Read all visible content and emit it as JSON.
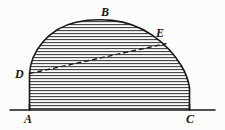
{
  "figure": {
    "kind": "geometry-diagram",
    "canvas": {
      "width": 225,
      "height": 130
    },
    "colors": {
      "paper": "#fbfbf9",
      "ink": "#1a1816",
      "hatch": "#3a3734",
      "dash": "#201e1b"
    }
  },
  "labels": [
    {
      "id": "A",
      "text": "A",
      "x": 24,
      "y": 113,
      "describes": "left foot of the arc on the base line"
    },
    {
      "id": "B",
      "text": "B",
      "x": 101,
      "y": 6,
      "describes": "apex of the arc"
    },
    {
      "id": "C",
      "text": "C",
      "x": 186,
      "y": 113,
      "describes": "right foot of the arc on the base line"
    },
    {
      "id": "D",
      "text": "D",
      "x": 15,
      "y": 68,
      "describes": "point on the left arc, left end of the dashed chord"
    },
    {
      "id": "E",
      "text": "E",
      "x": 156,
      "y": 27,
      "describes": "point on the right arc, right end of the dashed chord"
    }
  ],
  "geometry": {
    "baseline": {
      "name": "base-line",
      "x1": 10,
      "y1": 110,
      "x2": 215,
      "y2": 110
    },
    "arc": {
      "name": "dome-arc",
      "path": "M 29.5 110 L 29.5 74 C 30.5 52 48 28.5 76 22.2 C 88 19.6 100 19.2 112 20.4 C 142 23.4 167 42 181.5 66 C 186 73.6 188.6 81 189.5 88 L 189.5 110",
      "left_foot": {
        "x": 29.5,
        "y": 110
      },
      "apex": {
        "x": 104,
        "y": 20
      },
      "right_foot": {
        "x": 189.5,
        "y": 110
      }
    },
    "chord": {
      "name": "chord-DE",
      "style": "dashed",
      "from": {
        "label": "D",
        "x": 29.5,
        "y": 73.5
      },
      "to": {
        "label": "E",
        "x": 166.5,
        "y": 43.5
      },
      "dash_pattern": "5 3"
    },
    "hatching": {
      "name": "horizontal-hatch-fill",
      "orientation": "horizontal",
      "spacing_px": 3,
      "stroke_width_px": 1,
      "top_y": 23,
      "bottom_y": 109
    }
  }
}
